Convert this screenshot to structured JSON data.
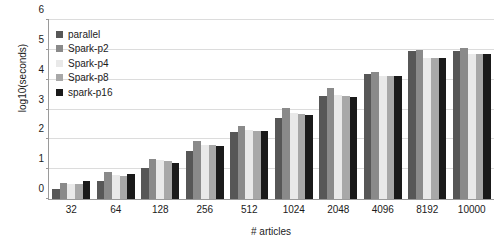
{
  "chart_data": {
    "type": "bar",
    "title": "",
    "xlabel": "# articles",
    "ylabel": "log10(seconds)",
    "categories": [
      "32",
      "64",
      "128",
      "256",
      "512",
      "1024",
      "2048",
      "4096",
      "8192",
      "10000"
    ],
    "ylim": [
      0,
      6
    ],
    "yticks": [
      "0",
      "1",
      "2",
      "3",
      "4",
      "5",
      "6"
    ],
    "grid": true,
    "legend_position": "top-left",
    "series": [
      {
        "name": "parallel",
        "color": "#575757",
        "values": [
          0.35,
          0.62,
          1.05,
          1.62,
          2.25,
          2.72,
          3.45,
          4.2,
          4.95,
          4.95
        ]
      },
      {
        "name": "Spark-p2",
        "color": "#8a8a8a",
        "values": [
          0.55,
          0.92,
          1.35,
          1.95,
          2.45,
          3.05,
          3.72,
          4.25,
          4.98,
          5.05
        ]
      },
      {
        "name": "Spark-p4",
        "color": "#e9e9e9",
        "values": [
          0.5,
          0.8,
          1.3,
          1.82,
          2.32,
          2.88,
          3.5,
          4.12,
          4.72,
          4.85
        ]
      },
      {
        "name": "Spark-p8",
        "color": "#a8a8a8",
        "values": [
          0.52,
          0.78,
          1.28,
          1.8,
          2.28,
          2.85,
          3.45,
          4.12,
          4.72,
          4.85
        ]
      },
      {
        "name": "spark-p16",
        "color": "#1a1a1a",
        "values": [
          0.62,
          0.85,
          1.22,
          1.78,
          2.28,
          2.82,
          3.42,
          4.12,
          4.72,
          4.85
        ]
      }
    ]
  }
}
